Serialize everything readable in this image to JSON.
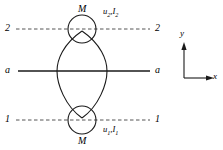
{
  "figure": {
    "name": "lens-shaped-body-cross-section-diagram",
    "background_color": "#ffffff",
    "stroke_color": "#1a1a1a",
    "dash_color": "#555555"
  },
  "labels": {
    "mass_top": "M",
    "mass_bottom": "M",
    "section_top_left": "2",
    "section_top_right": "2",
    "section_mid_left": "a",
    "section_mid_right": "a",
    "section_bottom_left": "1",
    "section_bottom_right": "1",
    "displacement_top": {
      "u": "u",
      "u_sub": "2",
      "sep": ",",
      "i": "I",
      "i_sub": "2"
    },
    "displacement_bottom": {
      "u": "u",
      "u_sub": "1",
      "sep": ",",
      "i": "I",
      "i_sub": "1"
    }
  },
  "axes": {
    "y_label": "y",
    "x_label": "x"
  },
  "geometry": {
    "line_a_a": {
      "y": 71,
      "x_start": 18,
      "x_end": 150,
      "style": "solid"
    },
    "line_2_2": {
      "y": 29,
      "x_start": 16,
      "x_end": 150,
      "style": "dashed"
    },
    "line_1_1": {
      "y": 120,
      "x_start": 16,
      "x_end": 150,
      "style": "dashed"
    },
    "circle_top": {
      "cx": 82,
      "cy": 29,
      "r": 14
    },
    "circle_bottom": {
      "cx": 82,
      "cy": 120,
      "r": 14
    },
    "lens": {
      "cx": 82,
      "top_y": 32,
      "bottom_y": 117,
      "half_width": 25
    }
  }
}
